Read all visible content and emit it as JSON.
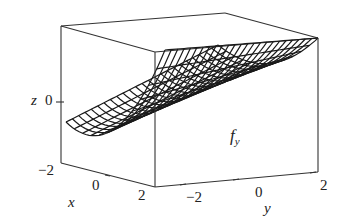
{
  "chart_data": {
    "type": "surface3d",
    "title": "",
    "function_label": "f_y",
    "function_label_main": "f",
    "function_label_sub": "y",
    "surface_description": "parabolic cylinder trough (U-shaped in x, constant along y), rendered as wireframe mesh",
    "xlabel": "x",
    "ylabel": "y",
    "zlabel": "z",
    "x_ticks": [
      "−2",
      "0",
      "2"
    ],
    "y_ticks": [
      "−2",
      "0",
      "2"
    ],
    "z_ticks": [
      "0"
    ],
    "xlim": [
      -2,
      2
    ],
    "ylim": [
      -2,
      2
    ],
    "grid_lines_x": 12,
    "grid_lines_y": 24,
    "box": true,
    "colors": {
      "mesh": "#1a1a1a",
      "box": "#333333",
      "background": "#ffffff"
    }
  },
  "labels": {
    "z_axis": "z",
    "z_tick_0": "0",
    "x_axis": "x",
    "x_tick_m2": "−2",
    "x_tick_0": "0",
    "x_tick_2": "2",
    "y_axis": "y",
    "y_tick_m2": "−2",
    "y_tick_0": "0",
    "y_tick_2": "2",
    "fn_main": "f",
    "fn_sub": "y"
  }
}
